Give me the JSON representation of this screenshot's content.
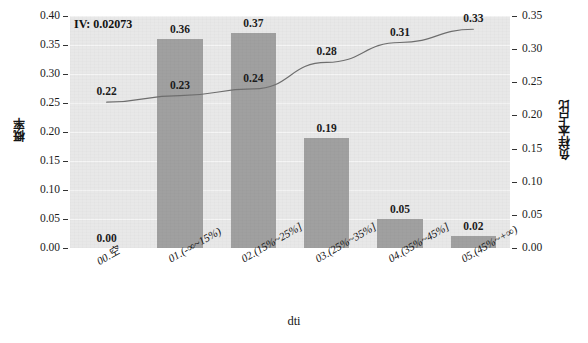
{
  "chart_data": {
    "type": "bar",
    "title": "",
    "annotation": "IV: 0.02073",
    "xlabel": "dti",
    "ylabel": "概率",
    "ylabel_right": "负样本占比",
    "categories": [
      "00.空",
      "01.(-∞~15%)",
      "02.(15%~25%]",
      "03.(25%~35%]",
      "04.(35%~45%]",
      "05.(45%~+∞)"
    ],
    "ylim": [
      0.0,
      0.4
    ],
    "ylim_right": [
      0.0,
      0.35
    ],
    "grid": true,
    "legend": "none",
    "series": [
      {
        "name": "概率",
        "type": "bar",
        "axis": "left",
        "color": "#a0a0a0",
        "values": [
          0.0,
          0.36,
          0.37,
          0.19,
          0.05,
          0.02
        ],
        "labels": [
          "0.00",
          "0.36",
          "0.37",
          "0.19",
          "0.05",
          "0.02"
        ]
      },
      {
        "name": "负样本占比",
        "type": "line",
        "axis": "right",
        "color": "#6e6e6e",
        "values": [
          0.22,
          0.23,
          0.24,
          0.28,
          0.31,
          0.33
        ],
        "labels": [
          "0.22",
          "0.23",
          "0.24",
          "0.28",
          "0.31",
          "0.33"
        ]
      }
    ],
    "yticks_left": [
      "0.40",
      "0.35",
      "0.30",
      "0.25",
      "0.20",
      "0.15",
      "0.10",
      "0.05",
      "0.00"
    ],
    "yticks_right": [
      "0.35",
      "0.30",
      "0.25",
      "0.20",
      "0.15",
      "0.10",
      "0.05",
      "0.00"
    ]
  },
  "colors": {
    "bar": "#a0a0a0",
    "line": "#6e6e6e",
    "plot_background": "#e8e8e8",
    "page_background": "#ffffff",
    "text": "#1a1a1a"
  }
}
